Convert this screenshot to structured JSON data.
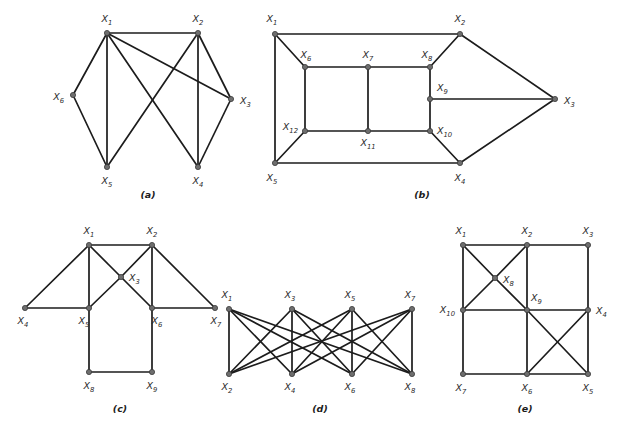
{
  "figure": {
    "background_color": "#ffffff",
    "edge_color": "#1c1c1c",
    "vertex_color": "#6e6e6e",
    "label_style": "italic X with numeric subscript"
  },
  "graphs": [
    {
      "id": "a",
      "caption": "(a)",
      "caption_pos": {
        "x": 148,
        "y": 198
      },
      "vertex_count": 6,
      "edge_count": 10,
      "vertices": [
        {
          "id": "X1",
          "base": "X",
          "sub": "1",
          "x": 107,
          "y": 33,
          "lx": 107,
          "ly": 22,
          "anchor": "middle"
        },
        {
          "id": "X2",
          "base": "X",
          "sub": "2",
          "x": 198,
          "y": 33,
          "lx": 198,
          "ly": 22,
          "anchor": "middle"
        },
        {
          "id": "X3",
          "base": "X",
          "sub": "3",
          "x": 231,
          "y": 99,
          "lx": 240,
          "ly": 104,
          "anchor": "start"
        },
        {
          "id": "X4",
          "base": "X",
          "sub": "4",
          "x": 198,
          "y": 167,
          "lx": 198,
          "ly": 184,
          "anchor": "middle"
        },
        {
          "id": "X5",
          "base": "X",
          "sub": "5",
          "x": 107,
          "y": 167,
          "lx": 107,
          "ly": 184,
          "anchor": "middle"
        },
        {
          "id": "X6",
          "base": "X",
          "sub": "6",
          "x": 73,
          "y": 95,
          "lx": 64,
          "ly": 100,
          "anchor": "end"
        }
      ],
      "edges": [
        [
          "X1",
          "X2"
        ],
        [
          "X1",
          "X6"
        ],
        [
          "X1",
          "X5"
        ],
        [
          "X1",
          "X4"
        ],
        [
          "X1",
          "X3"
        ],
        [
          "X2",
          "X3"
        ],
        [
          "X2",
          "X4"
        ],
        [
          "X2",
          "X5"
        ],
        [
          "X3",
          "X4"
        ],
        [
          "X6",
          "X5"
        ]
      ]
    },
    {
      "id": "b",
      "caption": "(b)",
      "caption_pos": {
        "x": 422,
        "y": 198
      },
      "vertex_count": 12,
      "edge_count": 18,
      "vertices": [
        {
          "id": "X1",
          "base": "X",
          "sub": "1",
          "x": 275,
          "y": 34,
          "lx": 272,
          "ly": 22,
          "anchor": "middle"
        },
        {
          "id": "X2",
          "base": "X",
          "sub": "2",
          "x": 460,
          "y": 34,
          "lx": 460,
          "ly": 22,
          "anchor": "middle"
        },
        {
          "id": "X3",
          "base": "X",
          "sub": "3",
          "x": 555,
          "y": 99,
          "lx": 564,
          "ly": 104,
          "anchor": "start"
        },
        {
          "id": "X4",
          "base": "X",
          "sub": "4",
          "x": 460,
          "y": 163,
          "lx": 460,
          "ly": 181,
          "anchor": "middle"
        },
        {
          "id": "X5",
          "base": "X",
          "sub": "5",
          "x": 275,
          "y": 163,
          "lx": 272,
          "ly": 181,
          "anchor": "middle"
        },
        {
          "id": "X6",
          "base": "X",
          "sub": "6",
          "x": 305,
          "y": 67,
          "lx": 306,
          "ly": 58,
          "anchor": "middle"
        },
        {
          "id": "X7",
          "base": "X",
          "sub": "7",
          "x": 368,
          "y": 67,
          "lx": 368,
          "ly": 58,
          "anchor": "middle"
        },
        {
          "id": "X8",
          "base": "X",
          "sub": "8",
          "x": 430,
          "y": 67,
          "lx": 427,
          "ly": 58,
          "anchor": "middle"
        },
        {
          "id": "X9",
          "base": "X",
          "sub": "9",
          "x": 430,
          "y": 99,
          "lx": 437,
          "ly": 91,
          "anchor": "start"
        },
        {
          "id": "X10",
          "base": "X",
          "sub": "10",
          "x": 430,
          "y": 131,
          "lx": 437,
          "ly": 134,
          "anchor": "start"
        },
        {
          "id": "X11",
          "base": "X",
          "sub": "11",
          "x": 368,
          "y": 131,
          "lx": 368,
          "ly": 146,
          "anchor": "middle"
        },
        {
          "id": "X12",
          "base": "X",
          "sub": "12",
          "x": 305,
          "y": 131,
          "lx": 298,
          "ly": 130,
          "anchor": "end"
        }
      ],
      "edges": [
        [
          "X1",
          "X2"
        ],
        [
          "X1",
          "X5"
        ],
        [
          "X1",
          "X6"
        ],
        [
          "X2",
          "X8"
        ],
        [
          "X2",
          "X3"
        ],
        [
          "X3",
          "X9"
        ],
        [
          "X3",
          "X4"
        ],
        [
          "X4",
          "X5"
        ],
        [
          "X4",
          "X10"
        ],
        [
          "X5",
          "X12"
        ],
        [
          "X6",
          "X7"
        ],
        [
          "X6",
          "X12"
        ],
        [
          "X7",
          "X8"
        ],
        [
          "X7",
          "X11"
        ],
        [
          "X8",
          "X9"
        ],
        [
          "X9",
          "X10"
        ],
        [
          "X10",
          "X11"
        ],
        [
          "X11",
          "X12"
        ]
      ]
    },
    {
      "id": "c",
      "caption": "(c)",
      "caption_pos": {
        "x": 120,
        "y": 412
      },
      "vertex_count": 9,
      "edge_count": 12,
      "vertices": [
        {
          "id": "X1",
          "base": "X",
          "sub": "1",
          "x": 89,
          "y": 245,
          "lx": 89,
          "ly": 234,
          "anchor": "middle"
        },
        {
          "id": "X2",
          "base": "X",
          "sub": "2",
          "x": 152,
          "y": 245,
          "lx": 152,
          "ly": 234,
          "anchor": "middle"
        },
        {
          "id": "X3",
          "base": "X",
          "sub": "3",
          "x": 121,
          "y": 277,
          "lx": 129,
          "ly": 281,
          "anchor": "start"
        },
        {
          "id": "X4",
          "base": "X",
          "sub": "4",
          "x": 25,
          "y": 308,
          "lx": 23,
          "ly": 324,
          "anchor": "middle"
        },
        {
          "id": "X5",
          "base": "X",
          "sub": "5",
          "x": 89,
          "y": 308,
          "lx": 84,
          "ly": 324,
          "anchor": "middle"
        },
        {
          "id": "X6",
          "base": "X",
          "sub": "6",
          "x": 152,
          "y": 308,
          "lx": 157,
          "ly": 324,
          "anchor": "middle"
        },
        {
          "id": "X7",
          "base": "X",
          "sub": "7",
          "x": 215,
          "y": 308,
          "lx": 216,
          "ly": 324,
          "anchor": "middle"
        },
        {
          "id": "X8",
          "base": "X",
          "sub": "8",
          "x": 89,
          "y": 372,
          "lx": 89,
          "ly": 389,
          "anchor": "middle"
        },
        {
          "id": "X9",
          "base": "X",
          "sub": "9",
          "x": 152,
          "y": 372,
          "lx": 152,
          "ly": 389,
          "anchor": "middle"
        }
      ],
      "edges": [
        [
          "X1",
          "X2"
        ],
        [
          "X1",
          "X4"
        ],
        [
          "X1",
          "X5"
        ],
        [
          "X1",
          "X3"
        ],
        [
          "X2",
          "X3"
        ],
        [
          "X2",
          "X6"
        ],
        [
          "X2",
          "X7"
        ],
        [
          "X3",
          "X5"
        ],
        [
          "X3",
          "X6"
        ],
        [
          "X4",
          "X5"
        ],
        [
          "X5",
          "X8"
        ],
        [
          "X6",
          "X7"
        ],
        [
          "X6",
          "X9"
        ],
        [
          "X8",
          "X9"
        ]
      ]
    },
    {
      "id": "d",
      "caption": "(d)",
      "caption_pos": {
        "x": 320,
        "y": 412
      },
      "vertex_count": 8,
      "edge_count": 16,
      "vertices": [
        {
          "id": "X1",
          "base": "X",
          "sub": "1",
          "x": 229,
          "y": 309,
          "lx": 227,
          "ly": 298,
          "anchor": "middle"
        },
        {
          "id": "X3",
          "base": "X",
          "sub": "3",
          "x": 292,
          "y": 309,
          "lx": 290,
          "ly": 298,
          "anchor": "middle"
        },
        {
          "id": "X5",
          "base": "X",
          "sub": "5",
          "x": 352,
          "y": 309,
          "lx": 350,
          "ly": 298,
          "anchor": "middle"
        },
        {
          "id": "X7",
          "base": "X",
          "sub": "7",
          "x": 412,
          "y": 309,
          "lx": 410,
          "ly": 298,
          "anchor": "middle"
        },
        {
          "id": "X2",
          "base": "X",
          "sub": "2",
          "x": 229,
          "y": 374,
          "lx": 227,
          "ly": 390,
          "anchor": "middle"
        },
        {
          "id": "X4",
          "base": "X",
          "sub": "4",
          "x": 292,
          "y": 374,
          "lx": 290,
          "ly": 390,
          "anchor": "middle"
        },
        {
          "id": "X6",
          "base": "X",
          "sub": "6",
          "x": 352,
          "y": 374,
          "lx": 350,
          "ly": 390,
          "anchor": "middle"
        },
        {
          "id": "X8",
          "base": "X",
          "sub": "8",
          "x": 412,
          "y": 374,
          "lx": 410,
          "ly": 390,
          "anchor": "middle"
        }
      ],
      "edges": [
        [
          "X1",
          "X2"
        ],
        [
          "X1",
          "X4"
        ],
        [
          "X1",
          "X6"
        ],
        [
          "X3",
          "X2"
        ],
        [
          "X3",
          "X4"
        ],
        [
          "X3",
          "X6"
        ],
        [
          "X5",
          "X2"
        ],
        [
          "X5",
          "X4"
        ],
        [
          "X5",
          "X6"
        ],
        [
          "X5",
          "X8"
        ],
        [
          "X7",
          "X2"
        ],
        [
          "X7",
          "X4"
        ],
        [
          "X7",
          "X6"
        ],
        [
          "X7",
          "X8"
        ],
        [
          "X3",
          "X8"
        ],
        [
          "X1",
          "X8"
        ]
      ]
    },
    {
      "id": "e",
      "caption": "(e)",
      "caption_pos": {
        "x": 525,
        "y": 412
      },
      "vertex_count": 10,
      "edge_count": 17,
      "vertices": [
        {
          "id": "X1",
          "base": "X",
          "sub": "1",
          "x": 463,
          "y": 245,
          "lx": 461,
          "ly": 234,
          "anchor": "middle"
        },
        {
          "id": "X2",
          "base": "X",
          "sub": "2",
          "x": 527,
          "y": 245,
          "lx": 527,
          "ly": 234,
          "anchor": "middle"
        },
        {
          "id": "X3",
          "base": "X",
          "sub": "3",
          "x": 588,
          "y": 245,
          "lx": 588,
          "ly": 234,
          "anchor": "middle"
        },
        {
          "id": "X4",
          "base": "X",
          "sub": "4",
          "x": 588,
          "y": 310,
          "lx": 596,
          "ly": 314,
          "anchor": "start"
        },
        {
          "id": "X5",
          "base": "X",
          "sub": "5",
          "x": 588,
          "y": 374,
          "lx": 588,
          "ly": 391,
          "anchor": "middle"
        },
        {
          "id": "X6",
          "base": "X",
          "sub": "6",
          "x": 527,
          "y": 374,
          "lx": 527,
          "ly": 391,
          "anchor": "middle"
        },
        {
          "id": "X7",
          "base": "X",
          "sub": "7",
          "x": 463,
          "y": 374,
          "lx": 461,
          "ly": 391,
          "anchor": "middle"
        },
        {
          "id": "X8",
          "base": "X",
          "sub": "8",
          "x": 495,
          "y": 278,
          "lx": 503,
          "ly": 283,
          "anchor": "start"
        },
        {
          "id": "X9",
          "base": "X",
          "sub": "9",
          "x": 527,
          "y": 310,
          "lx": 531,
          "ly": 301,
          "anchor": "start"
        },
        {
          "id": "X10",
          "base": "X",
          "sub": "10",
          "x": 463,
          "y": 310,
          "lx": 455,
          "ly": 313,
          "anchor": "end"
        }
      ],
      "edges": [
        [
          "X1",
          "X2"
        ],
        [
          "X2",
          "X3"
        ],
        [
          "X3",
          "X4"
        ],
        [
          "X4",
          "X5"
        ],
        [
          "X5",
          "X6"
        ],
        [
          "X6",
          "X7"
        ],
        [
          "X7",
          "X10"
        ],
        [
          "X10",
          "X1"
        ],
        [
          "X1",
          "X8"
        ],
        [
          "X8",
          "X2"
        ],
        [
          "X8",
          "X10"
        ],
        [
          "X8",
          "X9"
        ],
        [
          "X10",
          "X9"
        ],
        [
          "X9",
          "X2"
        ],
        [
          "X9",
          "X4"
        ],
        [
          "X9",
          "X6"
        ],
        [
          "X6",
          "X4"
        ],
        [
          "X9",
          "X5"
        ]
      ]
    }
  ]
}
